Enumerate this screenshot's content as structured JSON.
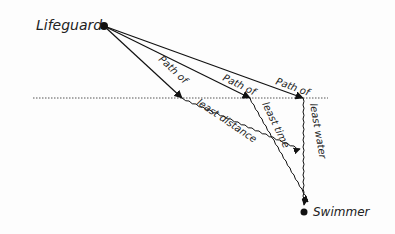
{
  "diagram": {
    "points": {
      "lifeguard": {
        "label": "Lifeguard",
        "x": 104,
        "y": 26
      },
      "swimmer": {
        "label": "Swimmer",
        "x": 304,
        "y": 212
      }
    },
    "shoreline": {
      "x1": 33,
      "x2": 328,
      "y": 98
    },
    "paths": [
      {
        "label_top": "Path of",
        "label_bottom": "least distance",
        "cross_x": 182
      },
      {
        "label_top": "Path of",
        "label_bottom": "least time",
        "cross_x": 250
      },
      {
        "label_top": "Path of",
        "label_bottom": "least water",
        "cross_x": 303
      }
    ]
  }
}
